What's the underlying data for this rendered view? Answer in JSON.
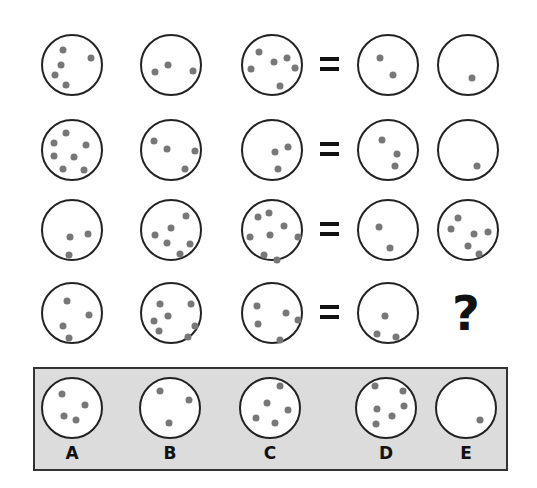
{
  "puzzle": {
    "equals_symbol": "=",
    "unknown_symbol": "?",
    "rows": [
      {
        "cells": [
          {
            "cx": 72,
            "cy": 65,
            "dots": [
              [
                61,
                48
              ],
              [
                89,
                56
              ],
              [
                59,
                63
              ],
              [
                53,
                73
              ],
              [
                64,
                83
              ]
            ]
          },
          {
            "cx": 171,
            "cy": 65,
            "dots": [
              [
                153,
                70
              ],
              [
                166,
                63
              ],
              [
                191,
                69
              ]
            ]
          },
          {
            "cx": 272,
            "cy": 65,
            "dots": [
              [
                257,
                50
              ],
              [
                249,
                67
              ],
              [
                272,
                60
              ],
              [
                285,
                56
              ],
              [
                293,
                66
              ],
              [
                278,
                84
              ]
            ]
          }
        ],
        "results": [
          {
            "cx": 388,
            "cy": 65,
            "dots": [
              [
                378,
                56
              ],
              [
                391,
                73
              ]
            ]
          },
          {
            "cx": 468,
            "cy": 65,
            "dots": [
              [
                470,
                76
              ]
            ]
          }
        ]
      },
      {
        "cells": [
          {
            "cx": 72,
            "cy": 150,
            "dots": [
              [
                64,
                131
              ],
              [
                52,
                141
              ],
              [
                84,
                143
              ],
              [
                52,
                154
              ],
              [
                72,
                155
              ],
              [
                61,
                167
              ],
              [
                82,
                168
              ]
            ]
          },
          {
            "cx": 171,
            "cy": 150,
            "dots": [
              [
                152,
                139
              ],
              [
                165,
                147
              ],
              [
                193,
                149
              ],
              [
                183,
                167
              ]
            ]
          },
          {
            "cx": 272,
            "cy": 150,
            "dots": [
              [
                273,
                150
              ],
              [
                286,
                145
              ],
              [
                276,
                167
              ]
            ]
          }
        ],
        "results": [
          {
            "cx": 388,
            "cy": 150,
            "dots": [
              [
                380,
                138
              ],
              [
                395,
                152
              ],
              [
                393,
                164
              ]
            ]
          },
          {
            "cx": 468,
            "cy": 150,
            "dots": [
              [
                475,
                164
              ]
            ]
          }
        ]
      },
      {
        "cells": [
          {
            "cx": 72,
            "cy": 230,
            "dots": [
              [
                68,
                235
              ],
              [
                86,
                232
              ],
              [
                67,
                253
              ]
            ]
          },
          {
            "cx": 171,
            "cy": 230,
            "dots": [
              [
                184,
                214
              ],
              [
                169,
                226
              ],
              [
                153,
                233
              ],
              [
                165,
                241
              ],
              [
                188,
                242
              ],
              [
                178,
                252
              ]
            ]
          },
          {
            "cx": 272,
            "cy": 230,
            "dots": [
              [
                256,
                215
              ],
              [
                267,
                211
              ],
              [
                282,
                224
              ],
              [
                248,
                235
              ],
              [
                268,
                233
              ],
              [
                296,
                235
              ],
              [
                262,
                253
              ],
              [
                275,
                258
              ]
            ]
          }
        ],
        "results": [
          {
            "cx": 388,
            "cy": 230,
            "dots": [
              [
                377,
                225
              ],
              [
                388,
                246
              ]
            ]
          },
          {
            "cx": 468,
            "cy": 230,
            "dots": [
              [
                456,
                216
              ],
              [
                449,
                227
              ],
              [
                472,
                232
              ],
              [
                486,
                230
              ],
              [
                466,
                244
              ],
              [
                477,
                252
              ]
            ]
          }
        ]
      },
      {
        "cells": [
          {
            "cx": 72,
            "cy": 313,
            "dots": [
              [
                65,
                299
              ],
              [
                87,
                313
              ],
              [
                61,
                324
              ],
              [
                67,
                336
              ]
            ]
          },
          {
            "cx": 171,
            "cy": 313,
            "dots": [
              [
                158,
                302
              ],
              [
                189,
                302
              ],
              [
                166,
                314
              ],
              [
                152,
                319
              ],
              [
                193,
                324
              ],
              [
                157,
                329
              ],
              [
                186,
                335
              ]
            ]
          },
          {
            "cx": 272,
            "cy": 313,
            "dots": [
              [
                255,
                304
              ],
              [
                284,
                311
              ],
              [
                296,
                318
              ],
              [
                256,
                322
              ],
              [
                278,
                338
              ]
            ]
          }
        ],
        "results": [
          {
            "cx": 388,
            "cy": 313,
            "dots": [
              [
                383,
                314
              ],
              [
                375,
                332
              ],
              [
                394,
                335
              ]
            ]
          }
        ]
      }
    ],
    "options": [
      {
        "label": "A",
        "cx": 72,
        "cy": 408,
        "dots": [
          [
            60,
            392
          ],
          [
            83,
            403
          ],
          [
            62,
            414
          ],
          [
            74,
            418
          ]
        ]
      },
      {
        "label": "B",
        "cx": 170,
        "cy": 408,
        "dots": [
          [
            158,
            389
          ],
          [
            187,
            398
          ],
          [
            167,
            421
          ]
        ]
      },
      {
        "label": "C",
        "cx": 270,
        "cy": 408,
        "dots": [
          [
            278,
            384
          ],
          [
            265,
            401
          ],
          [
            286,
            408
          ],
          [
            254,
            416
          ],
          [
            273,
            421
          ]
        ]
      },
      {
        "label": "D",
        "cx": 386,
        "cy": 408,
        "dots": [
          [
            373,
            384
          ],
          [
            401,
            389
          ],
          [
            375,
            407
          ],
          [
            402,
            404
          ],
          [
            390,
            414
          ],
          [
            374,
            422
          ]
        ]
      },
      {
        "label": "E",
        "cx": 466,
        "cy": 408,
        "dots": [
          [
            478,
            418
          ]
        ]
      }
    ],
    "colors": {
      "circle_stroke": "#222222",
      "dot_fill": "#777777",
      "options_background": "#dcdcdc",
      "text": "#111111"
    }
  }
}
